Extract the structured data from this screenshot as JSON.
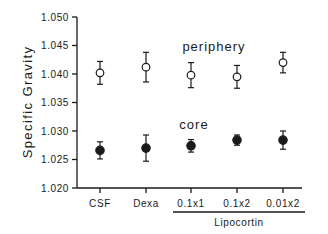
{
  "chart_data": {
    "type": "scatter",
    "title": "",
    "xlabel": "",
    "ylabel": "Specific Gravity",
    "ylim": [
      1.02,
      1.05
    ],
    "yticks": [
      "1.020",
      "1.025",
      "1.030",
      "1.035",
      "1.040",
      "1.045",
      "1.050"
    ],
    "categories": [
      "CSF",
      "Dexa",
      "0.1x1",
      "0.1x2",
      "0.01x2"
    ],
    "category_group": {
      "label": "Lipocortin",
      "members": [
        "0.1x1",
        "0.1x2",
        "0.01x2"
      ]
    },
    "grid": false,
    "legend": "inline labels",
    "series": [
      {
        "name": "periphery",
        "marker": "open-circle",
        "values": [
          1.0402,
          1.0412,
          1.0398,
          1.0395,
          1.042
        ],
        "errors": [
          0.002,
          0.0026,
          0.0022,
          0.002,
          0.0018
        ]
      },
      {
        "name": "core",
        "marker": "filled-circle",
        "values": [
          1.0266,
          1.027,
          1.0274,
          1.0284,
          1.0284
        ],
        "errors": [
          0.0015,
          0.0023,
          0.0011,
          0.0009,
          0.0016
        ]
      }
    ],
    "annotations": [
      {
        "text": "periphery",
        "x_between": [
          "Dexa",
          "0.1x2"
        ],
        "y": 1.0445
      },
      {
        "text": "core",
        "x_between": [
          "Dexa",
          "0.1x1"
        ],
        "y": 1.0315
      }
    ]
  },
  "colors": {
    "ink": "#1a1a1a",
    "background": "#ffffff"
  }
}
